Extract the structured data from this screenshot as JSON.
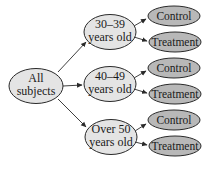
{
  "diagram": {
    "type": "tree",
    "colors": {
      "group_fill": "#e4e4e4",
      "leaf_fill": "#b8b8b8",
      "stroke": "#2a2a2a",
      "arrow": "#2a2a2a"
    },
    "root": {
      "line1": "All",
      "line2": "subjects"
    },
    "groups": [
      {
        "line1": "30–39",
        "line2": "years old",
        "leaves": [
          {
            "label": "Control"
          },
          {
            "label": "Treatment"
          }
        ]
      },
      {
        "line1": "40–49",
        "line2": "years old",
        "leaves": [
          {
            "label": "Control"
          },
          {
            "label": "Treatment"
          }
        ]
      },
      {
        "line1": "Over 50",
        "line2": "years old",
        "leaves": [
          {
            "label": "Control"
          },
          {
            "label": "Treatment"
          }
        ]
      }
    ]
  }
}
